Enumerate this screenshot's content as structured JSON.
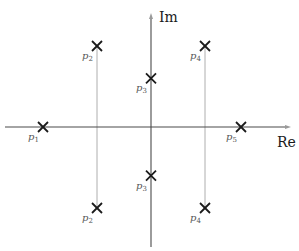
{
  "diagram": {
    "type": "pole-zero plot (s-plane)",
    "axes": {
      "real_label": "Re",
      "imag_label": "Im"
    },
    "poles": [
      {
        "id": "p1",
        "base": "p",
        "sub": "1",
        "re": -3.0,
        "im": 0.0
      },
      {
        "id": "p2_upper",
        "base": "p",
        "sub": "2",
        "re": -1.5,
        "im": 2.0
      },
      {
        "id": "p2_lower",
        "base": "p",
        "sub": "2",
        "re": -1.5,
        "im": -2.0
      },
      {
        "id": "p3_upper",
        "base": "p",
        "sub": "3",
        "re": 0.0,
        "im": 1.2
      },
      {
        "id": "p3_lower",
        "base": "p",
        "sub": "3",
        "re": 0.0,
        "im": -1.2
      },
      {
        "id": "p4_upper",
        "base": "p",
        "sub": "4",
        "re": 1.5,
        "im": 2.0
      },
      {
        "id": "p4_lower",
        "base": "p",
        "sub": "4",
        "re": 1.5,
        "im": -2.0
      },
      {
        "id": "p5",
        "base": "p",
        "sub": "5",
        "re": 2.5,
        "im": 0.0
      }
    ],
    "guides": [
      {
        "id": "p2-guide",
        "re": -1.5,
        "from_im": -2.0,
        "to_im": 2.0
      },
      {
        "id": "p4-guide",
        "re": 1.5,
        "from_im": -2.0,
        "to_im": 2.0
      }
    ],
    "marker": "x-cross"
  }
}
